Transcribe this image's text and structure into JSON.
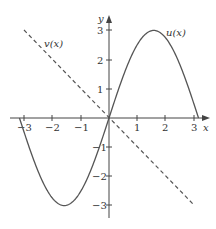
{
  "chart_data": {
    "type": "line",
    "title": "",
    "xlabel": "x",
    "ylabel": "y",
    "xlim": [
      -3.2,
      3.5
    ],
    "ylim": [
      -3.5,
      3.8
    ],
    "grid": false,
    "legend": "none (inline curve labels)",
    "x_ticks": [
      -3,
      -2,
      -1,
      1,
      2,
      3
    ],
    "x_tick_labels": [
      "−3",
      "−2",
      "−1",
      "1",
      "2",
      "3"
    ],
    "y_ticks": [
      -3,
      -2,
      -1,
      1,
      2,
      3
    ],
    "y_tick_labels": [
      "−3",
      "−2",
      "−1",
      "1",
      "2",
      "3"
    ],
    "series": [
      {
        "name": "u(x)",
        "style": "solid",
        "formula": "3 sin(x)",
        "x": [
          -3.14,
          -2.5,
          -2.0,
          -1.57,
          -1.0,
          -0.5,
          0,
          0.5,
          1.0,
          1.57,
          2.0,
          2.5,
          3.14
        ],
        "values": [
          0,
          -1.8,
          -2.73,
          -3.0,
          -2.52,
          -1.44,
          0,
          1.44,
          2.52,
          3.0,
          2.73,
          1.8,
          0
        ]
      },
      {
        "name": "v(x)",
        "style": "dashed",
        "formula": "-x",
        "x": [
          -3,
          0,
          3
        ],
        "values": [
          3,
          0,
          -3
        ]
      }
    ],
    "annotations": [
      {
        "text": "u(x)",
        "x": 2.1,
        "y": 3.0
      },
      {
        "text": "v(x)",
        "x": -2.2,
        "y": 2.5
      }
    ]
  },
  "labels": {
    "x_axis": "x",
    "y_axis": "y",
    "u": "u(x)",
    "v": "v(x)",
    "xt": [
      "−3",
      "−2",
      "−1",
      "1",
      "2",
      "3"
    ],
    "yt": [
      "3",
      "2",
      "1",
      "−1",
      "−2",
      "−3"
    ]
  },
  "colors": {
    "axis": "#444444",
    "curve": "#555555"
  }
}
